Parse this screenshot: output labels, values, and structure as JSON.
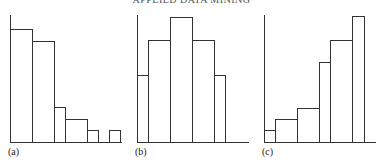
{
  "header": "APPLIED DATA MINING",
  "chart_data": [
    {
      "type": "bar",
      "title": "",
      "label": "(a)",
      "grid": false,
      "xlabel": "",
      "ylabel": "",
      "bins": [
        [
          0,
          1
        ],
        [
          1,
          2
        ],
        [
          2,
          2.5
        ],
        [
          2.5,
          3.5
        ],
        [
          3.5,
          4
        ],
        [
          4,
          4.5
        ],
        [
          4.5,
          5
        ]
      ],
      "values": [
        112,
        101,
        35,
        23,
        12,
        0,
        12
      ],
      "ylim": [
        0,
        126
      ]
    },
    {
      "type": "bar",
      "title": "",
      "label": "(b)",
      "grid": false,
      "xlabel": "",
      "ylabel": "",
      "bins": [
        [
          0,
          0.5
        ],
        [
          0.5,
          1.5
        ],
        [
          1.5,
          2.5
        ],
        [
          2.5,
          3.5
        ],
        [
          3.5,
          4
        ]
      ],
      "values": [
        67,
        102,
        125,
        102,
        67
      ],
      "ylim": [
        0,
        126
      ]
    },
    {
      "type": "bar",
      "title": "",
      "label": "(c)",
      "grid": false,
      "xlabel": "",
      "ylabel": "",
      "bins": [
        [
          0,
          0.5
        ],
        [
          0.5,
          1.5
        ],
        [
          1.5,
          2.5
        ],
        [
          2.5,
          3
        ],
        [
          3,
          4
        ],
        [
          4,
          4.5
        ]
      ],
      "values": [
        12,
        23,
        34,
        80,
        102,
        126
      ],
      "ylim": [
        0,
        126
      ]
    }
  ],
  "panels": [
    {
      "label": "(a)",
      "axisX": 10,
      "baseEnd": 122,
      "bars": [
        {
          "x": 10,
          "w": 22,
          "top": 29
        },
        {
          "x": 32,
          "w": 22,
          "top": 41
        },
        {
          "x": 54,
          "w": 11,
          "top": 107
        },
        {
          "x": 65,
          "w": 22,
          "top": 119
        },
        {
          "x": 87,
          "w": 11,
          "top": 130
        },
        {
          "x": 109,
          "w": 11,
          "top": 130
        }
      ]
    },
    {
      "label": "(b)",
      "axisX": 137,
      "baseEnd": 249,
      "bars": [
        {
          "x": 137,
          "w": 11,
          "top": 75
        },
        {
          "x": 148,
          "w": 22,
          "top": 40
        },
        {
          "x": 170,
          "w": 22,
          "top": 17
        },
        {
          "x": 192,
          "w": 22,
          "top": 40
        },
        {
          "x": 214,
          "w": 11,
          "top": 75
        }
      ]
    },
    {
      "label": "(c)",
      "axisX": 264,
      "baseEnd": 376,
      "bars": [
        {
          "x": 264,
          "w": 11,
          "top": 130
        },
        {
          "x": 275,
          "w": 22,
          "top": 119
        },
        {
          "x": 297,
          "w": 22,
          "top": 108
        },
        {
          "x": 319,
          "w": 11,
          "top": 62
        },
        {
          "x": 330,
          "w": 22,
          "top": 40
        },
        {
          "x": 352,
          "w": 12,
          "top": 16
        }
      ]
    }
  ]
}
